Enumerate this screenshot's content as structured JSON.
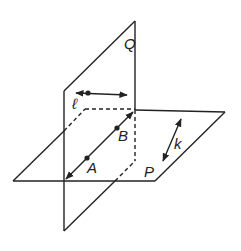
{
  "diagram": {
    "colors": {
      "stroke": "#222222",
      "background": "#ffffff"
    },
    "labels": {
      "plane_q": "Q",
      "plane_p": "P",
      "line_l": "ℓ",
      "line_k": "k",
      "point_a": "A",
      "point_b": "B"
    }
  }
}
